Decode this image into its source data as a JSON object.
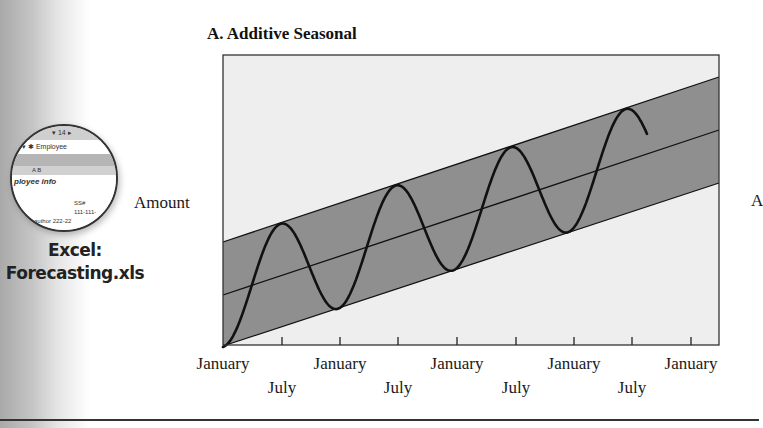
{
  "sidebar": {
    "badge_icon": "excel-spreadsheet-icon",
    "badge_cells": [
      "▾ 14 ▸",
      "▾   ✱ Employee",
      "",
      "A          B",
      "ployee info",
      "SS#",
      "111-111-",
      "author   222-22"
    ],
    "caption_line1": "Excel:",
    "caption_line2": "Forecasting.xls"
  },
  "chart_data": {
    "type": "line",
    "title": "A. Additive Seasonal",
    "xlabel": "",
    "ylabel": "Amount",
    "grid": false,
    "legend": null,
    "x_tick_labels": [
      "January",
      "July",
      "January",
      "July",
      "January",
      "July",
      "January",
      "July",
      "January"
    ],
    "x_ticks_major": [
      "January",
      "January",
      "January",
      "January",
      "January"
    ],
    "x_ticks_minor": [
      "July",
      "July",
      "July",
      "July"
    ],
    "x_range_months": [
      0,
      48
    ],
    "ylim": [
      0,
      100
    ],
    "series": [
      {
        "name": "Trend line",
        "kind": "line",
        "x_months": [
          0,
          48
        ],
        "values": [
          18,
          74
        ]
      },
      {
        "name": "Upper band",
        "kind": "line",
        "x_months": [
          0,
          48
        ],
        "values": [
          36,
          92
        ]
      },
      {
        "name": "Lower band",
        "kind": "line",
        "x_months": [
          0,
          48
        ],
        "values": [
          0,
          56
        ]
      },
      {
        "name": "Seasonal demand",
        "kind": "line",
        "period_months": 11.1,
        "amplitude": 18,
        "description": "Sine wave oscillating between lower and upper bands around rising trend; starts at a trough at month 0, peaks near months 5.5, 16.5, 28, 39, ends near month 41.5",
        "peaks_x_months": [
          5.5,
          16.5,
          28,
          39
        ],
        "peaks_values": [
          41,
          54,
          68,
          81
        ],
        "troughs_x_months": [
          0,
          11,
          22.5,
          33.5
        ],
        "troughs_values": [
          0,
          12,
          24,
          38
        ]
      }
    ],
    "shaded_region": {
      "between": [
        "Lower band",
        "Upper band"
      ],
      "color": "#8f8f8f"
    },
    "plot_background": "#eeeeee"
  },
  "labels": {
    "y_axis": "Amount",
    "clipped_right": "A",
    "january": "January",
    "july": "July"
  },
  "colors": {
    "band": "#8f8f8f",
    "plot_bg": "#eeeeee",
    "line": "#111111"
  }
}
